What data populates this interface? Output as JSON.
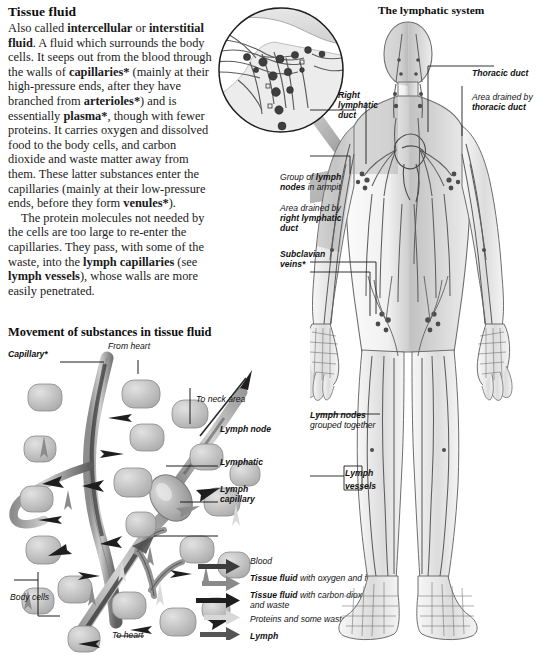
{
  "article": {
    "title": "Tissue fluid",
    "paragraph1_html": "Also called <b>intercellular</b> or <b>interstitial fluid</b>. A fluid which surrounds the body cells. It seeps out from the blood through the walls of <b>capillaries*</b> (mainly at their high-pressure ends, after they have branched from <b>arterioles*</b>) and is essentially <b>plasma*</b>, though with fewer proteins. It carries oxygen and dissolved food to the body cells, and carbon dioxide and waste matter away from them. These latter substances enter the capillaries (mainly at their low-pressure ends, before they form <b>venules*</b>).",
    "paragraph2_html": "The protein molecules not needed by the cells are too large to re-enter the capillaries. They pass, with some of the waste, into the <b>lymph capillaries</b> (see <b>lymph vessels</b>), whose walls are more easily penetrated."
  },
  "tissue_diagram": {
    "heading": "Movement of substances in tissue fluid",
    "labels": {
      "capillary": "Capillary*",
      "from_heart": "From heart",
      "to_neck_area": "To neck area",
      "lymph_node": "Lymph node",
      "lymphatic": "Lymphatic",
      "lymph_capillary_line1": "Lymph",
      "lymph_capillary_line2": "capillary",
      "body_cells": "Body cells",
      "to_heart": "To heart"
    },
    "legend": [
      {
        "label_html": "Blood",
        "color": "#3b3b3b"
      },
      {
        "label_html": "<b>Tissue fluid</b> with oxygen and food",
        "color": "#8a8a8a"
      },
      {
        "label_html": "<b>Tissue fluid</b> with carbon dioxide<br>and waste",
        "color": "#1e1e1e"
      },
      {
        "label_html": "Proteins and some waste",
        "color": "#d8d8d8"
      },
      {
        "label_html": "<b>Lymph</b>",
        "color": "#555555"
      }
    ]
  },
  "lymphatic_panel": {
    "title": "The lymphatic system",
    "labels": {
      "right_lymphatic_duct_l1": "Right",
      "right_lymphatic_duct_l2": "lymphatic",
      "right_lymphatic_duct_l3": "duct",
      "thoracic_duct": "Thoracic duct",
      "area_drained_thoracic_l1": "Area drained by",
      "area_drained_thoracic_l2": "thoracic duct",
      "armpit_nodes_l1_html": "Group of <b>lymph</b>",
      "armpit_nodes_l2_html": "<b>nodes</b> in armpit",
      "area_drained_right_l1": "Area drained by",
      "area_drained_right_l2": "right lymphatic",
      "area_drained_right_l3": "duct",
      "subclavian_veins_l1": "Subclavian",
      "subclavian_veins_l2": "veins*",
      "lymph_nodes_l1": "Lymph nodes",
      "lymph_nodes_l2": "grouped together",
      "lymph_vessels_l1": "Lymph",
      "lymph_vessels_l2": "vessels"
    }
  },
  "palette": {
    "ink": "#1d1d1d",
    "vessel_dark": "#4a4a4a",
    "vessel_mid": "#7b7b7b",
    "cell_fill": "#b9b9b9",
    "body_fill": "#f2f2f2",
    "shade_gray": "#b0b0b0"
  }
}
